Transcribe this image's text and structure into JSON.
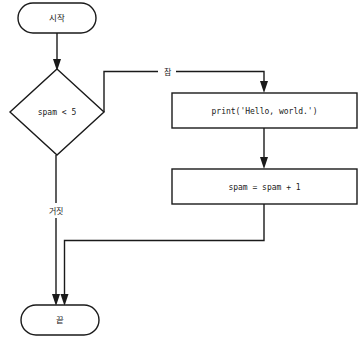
{
  "diagram": {
    "type": "flowchart",
    "colors": {
      "background": "#ffffff",
      "stroke": "#1a1a1a",
      "node_fill": "#ffffff"
    },
    "nodes": [
      {
        "id": "start",
        "shape": "stadium",
        "label": "시작",
        "x": 57,
        "y": 18,
        "width": 78,
        "height": 30
      },
      {
        "id": "decision",
        "shape": "diamond",
        "label": "spam < 5",
        "x": 57,
        "y": 112,
        "width": 94,
        "height": 86
      },
      {
        "id": "print",
        "shape": "rect",
        "label": "print('Hello, world.')",
        "x": 264,
        "y": 110,
        "width": 185,
        "height": 35
      },
      {
        "id": "increment",
        "shape": "rect",
        "label": "spam = spam + 1",
        "x": 264,
        "y": 186,
        "width": 185,
        "height": 35
      },
      {
        "id": "end",
        "shape": "stadium",
        "label": "끝",
        "x": 60,
        "y": 320,
        "width": 78,
        "height": 30
      }
    ],
    "edges": [
      {
        "id": "start-to-decision",
        "from": "start",
        "to": "decision",
        "label": "",
        "arrow": true
      },
      {
        "id": "decision-true-to-print",
        "from": "decision",
        "to": "print",
        "label": "참",
        "arrow": true
      },
      {
        "id": "print-to-increment",
        "from": "print",
        "to": "increment",
        "label": "",
        "arrow": true
      },
      {
        "id": "increment-loop-to-end",
        "from": "increment",
        "to": "end",
        "label": "",
        "arrow": true
      },
      {
        "id": "decision-false-to-end",
        "from": "decision",
        "to": "end",
        "label": "거짓",
        "arrow": true
      }
    ]
  }
}
